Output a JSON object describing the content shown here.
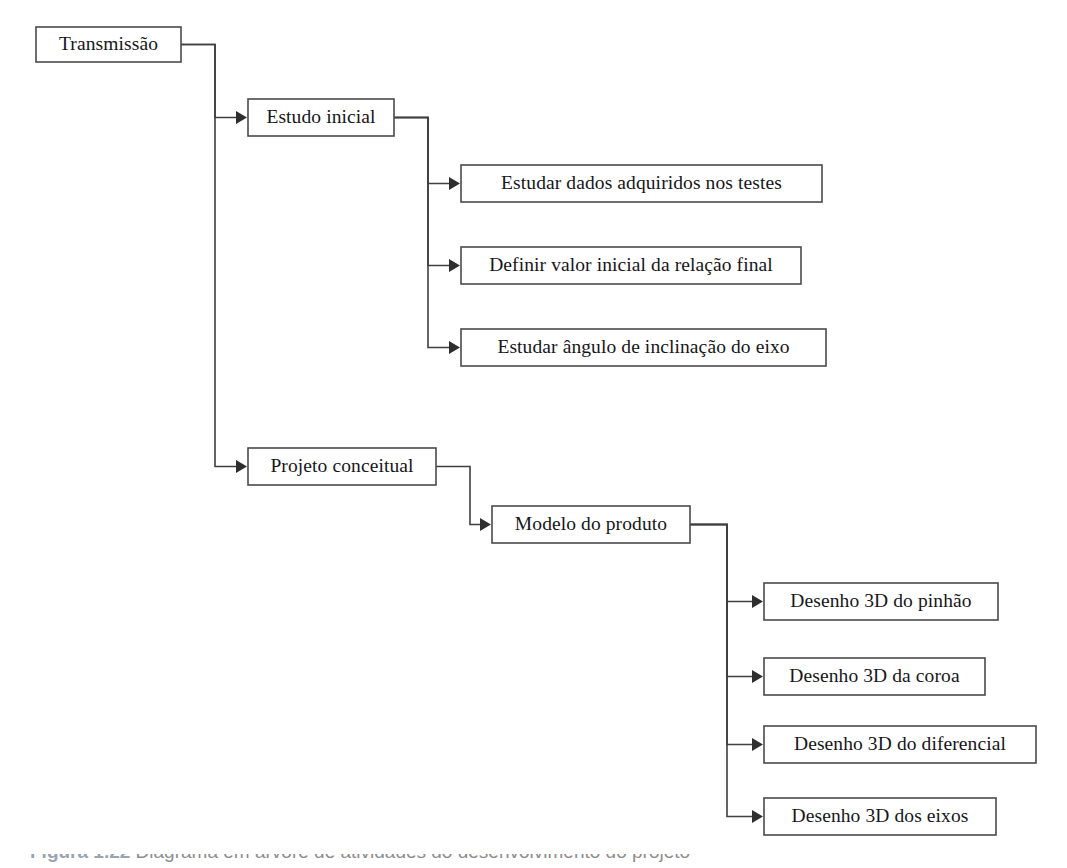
{
  "diagram": {
    "title": "Transmissão",
    "type": "tree-flowchart",
    "orientation": "left-to-right",
    "background_color": "#ffffff",
    "box_border_color": "#4a4a4a",
    "line_color": "#3f3f3f",
    "text_color": "#16161a",
    "nodes": [
      {
        "id": "transmissao",
        "label": "Transmissão",
        "x": 36,
        "y": 27,
        "w": 145,
        "h": 35,
        "level": 0
      },
      {
        "id": "estudo",
        "label": "Estudo inicial",
        "x": 248,
        "y": 99,
        "w": 146,
        "h": 37,
        "level": 1
      },
      {
        "id": "estudar_dados",
        "label": "Estudar dados adquiridos nos testes",
        "x": 461,
        "y": 165,
        "w": 361,
        "h": 37,
        "level": 2
      },
      {
        "id": "definir_valor",
        "label": "Definir valor inicial da relação final",
        "x": 461,
        "y": 247,
        "w": 340,
        "h": 37,
        "level": 2
      },
      {
        "id": "estudar_angulo",
        "label": "Estudar ângulo de inclinação do eixo",
        "x": 461,
        "y": 329,
        "w": 365,
        "h": 37,
        "level": 2
      },
      {
        "id": "projeto",
        "label": "Projeto conceitual",
        "x": 248,
        "y": 448,
        "w": 188,
        "h": 37,
        "level": 1
      },
      {
        "id": "modelo",
        "label": "Modelo do produto",
        "x": 492,
        "y": 506,
        "w": 198,
        "h": 37,
        "level": 2
      },
      {
        "id": "des_pinhao",
        "label": "Desenho 3D do pinhão",
        "x": 764,
        "y": 583,
        "w": 234,
        "h": 37,
        "level": 3
      },
      {
        "id": "des_coroa",
        "label": "Desenho 3D da coroa",
        "x": 764,
        "y": 658,
        "w": 221,
        "h": 37,
        "level": 3
      },
      {
        "id": "des_dif",
        "label": "Desenho 3D do diferencial",
        "x": 764,
        "y": 726,
        "w": 272,
        "h": 37,
        "level": 3
      },
      {
        "id": "des_eixos",
        "label": "Desenho 3D dos eixos",
        "x": 764,
        "y": 798,
        "w": 232,
        "h": 37,
        "level": 3
      }
    ],
    "edges": [
      {
        "id": "e-transmissao-estudo",
        "from": "transmissao",
        "to": "estudo",
        "trunk_x": 215,
        "from_y": 44.5,
        "to_y": 117.5
      },
      {
        "id": "e-transmissao-projeto",
        "from": "transmissao",
        "to": "projeto",
        "trunk_x": 215,
        "from_y": 44.5,
        "to_y": 466.5
      },
      {
        "id": "e-estudo-dados",
        "from": "estudo",
        "to": "estudar_dados",
        "trunk_x": 428,
        "from_y": 117.5,
        "to_y": 183.5
      },
      {
        "id": "e-estudo-definir",
        "from": "estudo",
        "to": "definir_valor",
        "trunk_x": 428,
        "from_y": 117.5,
        "to_y": 265.5
      },
      {
        "id": "e-estudo-angulo",
        "from": "estudo",
        "to": "estudar_angulo",
        "trunk_x": 428,
        "from_y": 117.5,
        "to_y": 347.5
      },
      {
        "id": "e-projeto-modelo",
        "from": "projeto",
        "to": "modelo",
        "trunk_x": 470,
        "from_y": 466.5,
        "to_y": 524.5
      },
      {
        "id": "e-modelo-pinhao",
        "from": "modelo",
        "to": "des_pinhao",
        "trunk_x": 727,
        "from_y": 524.5,
        "to_y": 601.5
      },
      {
        "id": "e-modelo-coroa",
        "from": "modelo",
        "to": "des_coroa",
        "trunk_x": 727,
        "from_y": 524.5,
        "to_y": 676.5
      },
      {
        "id": "e-modelo-diferencial",
        "from": "modelo",
        "to": "des_dif",
        "trunk_x": 727,
        "from_y": 524.5,
        "to_y": 744.5
      },
      {
        "id": "e-modelo-eixos",
        "from": "modelo",
        "to": "des_eixos",
        "trunk_x": 727,
        "from_y": 524.5,
        "to_y": 816.5
      }
    ]
  },
  "caption": {
    "number": "Figura 1.22",
    "text": "Diagrama em árvore de atividades do desenvolvimento do projeto",
    "clipped": true
  }
}
